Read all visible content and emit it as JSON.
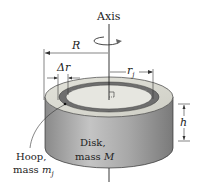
{
  "diagram": {
    "labels": {
      "axis": "Axis",
      "R": "R",
      "delta_r": "Δr",
      "r_j_main": "r",
      "r_j_sub": "j",
      "h": "h",
      "disk_line1": "Disk,",
      "disk_line2_prefix": "mass ",
      "disk_line2_var": "M",
      "hoop_line1": "Hoop,",
      "hoop_line2_prefix": "mass ",
      "hoop_line2_var": "m",
      "hoop_line2_sub": "j"
    },
    "colors": {
      "disk_side": "#9a9a9a",
      "disk_side_light": "#c9c9c9",
      "disk_top": "#dcdcd4",
      "hoop_ring": "#6e6e6e",
      "inner_top": "#e8e8e2",
      "line": "#222222"
    },
    "elements": [
      {
        "name": "rotation-axis",
        "type": "vertical line through center"
      },
      {
        "name": "rotation-arrow",
        "type": "circular arrow around axis"
      },
      {
        "name": "disk",
        "type": "cylinder",
        "label": "Disk, mass M"
      },
      {
        "name": "hoop",
        "type": "dark ring on top face",
        "label": "Hoop, mass m_j"
      },
      {
        "name": "dimension-R",
        "type": "outer radius arrow"
      },
      {
        "name": "dimension-delta-r",
        "type": "hoop thickness arrows"
      },
      {
        "name": "dimension-r-j",
        "type": "hoop radius arrow"
      },
      {
        "name": "dimension-h",
        "type": "height arrow"
      },
      {
        "name": "right-angle-marker",
        "type": "square at center"
      }
    ]
  }
}
